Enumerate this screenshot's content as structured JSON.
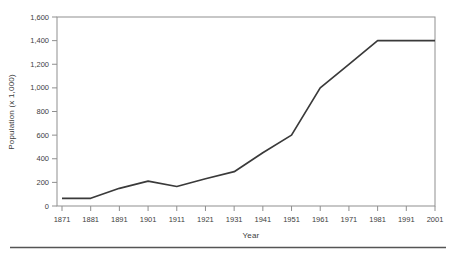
{
  "page": {
    "background": "#ffffff",
    "divider_color": "#555555"
  },
  "chart_data": {
    "type": "line",
    "title": "",
    "xlabel": "Year",
    "ylabel": "Population (x 1,000)",
    "x": [
      1871,
      1881,
      1891,
      1901,
      1911,
      1921,
      1931,
      1941,
      1951,
      1961,
      1971,
      1981,
      1991,
      2001
    ],
    "x_tick_labels": [
      "1871",
      "1881",
      "1891",
      "1901",
      "1911",
      "1921",
      "1931",
      "1941",
      "1951",
      "1961",
      "1971",
      "1981",
      "1991",
      "2001"
    ],
    "series": [
      {
        "name": "Population",
        "values": [
          65,
          65,
          150,
          210,
          165,
          230,
          290,
          450,
          600,
          1000,
          1200,
          1400,
          1400,
          1400
        ]
      }
    ],
    "xlim": [
      1871,
      2001
    ],
    "ylim": [
      0,
      1600
    ],
    "y_tick_step": 200,
    "y_tick_values": [
      0,
      200,
      400,
      600,
      800,
      1000,
      1200,
      1400,
      1600
    ],
    "y_tick_labels": [
      "0",
      "200",
      "400",
      "600",
      "800",
      "1,000",
      "1,200",
      "1,400",
      "1,600"
    ],
    "grid": false,
    "legend": null,
    "plot_border": "box",
    "line_color": "#3a3a3a",
    "axis_color": "#8f8f8f",
    "text_color": "#404040"
  }
}
